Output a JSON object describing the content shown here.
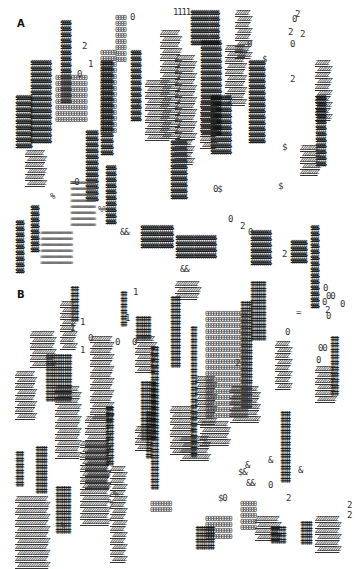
{
  "figure": {
    "panels": [
      {
        "id": "A",
        "label": "A",
        "label_pos": [
          17,
          24
        ],
        "legend_symbols": [
          "$",
          "0",
          "2",
          "Z",
          "=",
          "&",
          "%",
          "1"
        ],
        "blobs": [
          {
            "type": "dollar",
            "x": 60,
            "y": 20,
            "cols": 5,
            "rows": 14,
            "ch": "$"
          },
          {
            "type": "dollar",
            "x": 30,
            "y": 60,
            "cols": 10,
            "rows": 14,
            "ch": "$"
          },
          {
            "type": "zero",
            "x": 55,
            "y": 75,
            "cols": 12,
            "rows": 8,
            "ch": "0"
          },
          {
            "type": "dollar",
            "x": 15,
            "y": 95,
            "cols": 8,
            "rows": 9,
            "ch": "$"
          },
          {
            "type": "zero",
            "x": 115,
            "y": 15,
            "cols": 4,
            "rows": 8,
            "ch": "0"
          },
          {
            "type": "zero",
            "x": 100,
            "y": 50,
            "cols": 6,
            "rows": 14,
            "ch": "0"
          },
          {
            "type": "dollar",
            "x": 100,
            "y": 60,
            "cols": 6,
            "rows": 16,
            "ch": "$"
          },
          {
            "type": "dollar",
            "x": 130,
            "y": 50,
            "cols": 5,
            "rows": 12,
            "ch": "$"
          },
          {
            "type": "hatch",
            "x": 145,
            "y": 80,
            "cols": 10,
            "rows": 10,
            "ch": "Z"
          },
          {
            "type": "hatch",
            "x": 160,
            "y": 30,
            "cols": 8,
            "rows": 18,
            "ch": "Z"
          },
          {
            "type": "dollar",
            "x": 190,
            "y": 10,
            "cols": 14,
            "rows": 6,
            "ch": "$"
          },
          {
            "type": "hatch",
            "x": 235,
            "y": 10,
            "cols": 6,
            "rows": 8,
            "ch": "Z"
          },
          {
            "type": "dollar",
            "x": 200,
            "y": 40,
            "cols": 10,
            "rows": 16,
            "ch": "$"
          },
          {
            "type": "hatch",
            "x": 175,
            "y": 55,
            "cols": 8,
            "rows": 14,
            "ch": "Z"
          },
          {
            "type": "hatch",
            "x": 225,
            "y": 45,
            "cols": 8,
            "rows": 10,
            "ch": "Z"
          },
          {
            "type": "dollar",
            "x": 248,
            "y": 60,
            "cols": 8,
            "rows": 14,
            "ch": "$"
          },
          {
            "type": "dollar",
            "x": 210,
            "y": 95,
            "cols": 10,
            "rows": 10,
            "ch": "$"
          },
          {
            "type": "hatch",
            "x": 200,
            "y": 100,
            "cols": 6,
            "rows": 8,
            "ch": "Z"
          },
          {
            "type": "hatch",
            "x": 315,
            "y": 60,
            "cols": 6,
            "rows": 10,
            "ch": "Z"
          },
          {
            "type": "dollar",
            "x": 315,
            "y": 95,
            "cols": 5,
            "rows": 12,
            "ch": "$"
          },
          {
            "type": "hatch",
            "x": 300,
            "y": 145,
            "cols": 8,
            "rows": 5,
            "ch": "Z"
          },
          {
            "type": "dollar",
            "x": 170,
            "y": 140,
            "cols": 8,
            "rows": 10,
            "ch": "$"
          },
          {
            "type": "hatch",
            "x": 175,
            "y": 140,
            "cols": 7,
            "rows": 4,
            "ch": "Z"
          },
          {
            "type": "dollar",
            "x": 85,
            "y": 130,
            "cols": 6,
            "rows": 12,
            "ch": "$"
          },
          {
            "type": "hatch",
            "x": 25,
            "y": 150,
            "cols": 8,
            "rows": 6,
            "ch": "Z"
          },
          {
            "type": "dash",
            "x": 70,
            "y": 180,
            "cols": 14,
            "rows": 8,
            "ch": "="
          },
          {
            "type": "dash",
            "x": 40,
            "y": 230,
            "cols": 18,
            "rows": 6,
            "ch": "="
          },
          {
            "type": "dollar",
            "x": 15,
            "y": 220,
            "cols": 4,
            "rows": 9,
            "ch": "$"
          },
          {
            "type": "dollar",
            "x": 30,
            "y": 205,
            "cols": 4,
            "rows": 8,
            "ch": "$"
          },
          {
            "type": "dollar",
            "x": 105,
            "y": 165,
            "cols": 5,
            "rows": 10,
            "ch": "$"
          },
          {
            "type": "dollar",
            "x": 140,
            "y": 225,
            "cols": 16,
            "rows": 4,
            "ch": "$"
          },
          {
            "type": "dollar",
            "x": 175,
            "y": 235,
            "cols": 20,
            "rows": 4,
            "ch": "$"
          },
          {
            "type": "dollar",
            "x": 250,
            "y": 230,
            "cols": 10,
            "rows": 6,
            "ch": "$"
          },
          {
            "type": "dollar",
            "x": 310,
            "y": 225,
            "cols": 4,
            "rows": 14,
            "ch": "$"
          },
          {
            "type": "dollar",
            "x": 290,
            "y": 240,
            "cols": 8,
            "rows": 4,
            "ch": "$"
          }
        ],
        "singles": [
          {
            "x": 173,
            "y": 8,
            "t": "1111"
          },
          {
            "x": 82,
            "y": 42,
            "t": "2"
          },
          {
            "x": 88,
            "y": 60,
            "t": "1"
          },
          {
            "x": 77,
            "y": 70,
            "t": "0"
          },
          {
            "x": 135,
            "y": 100,
            "t": "2"
          },
          {
            "x": 130,
            "y": 13,
            "t": "0"
          },
          {
            "x": 295,
            "y": 10,
            "t": "2"
          },
          {
            "x": 300,
            "y": 30,
            "t": "2"
          },
          {
            "x": 290,
            "y": 40,
            "t": "0"
          },
          {
            "x": 292,
            "y": 15,
            "t": "0"
          },
          {
            "x": 288,
            "y": 28,
            "t": "2"
          },
          {
            "x": 290,
            "y": 75,
            "t": "2"
          },
          {
            "x": 247,
            "y": 40,
            "t": "0"
          },
          {
            "x": 262,
            "y": 55,
            "t": "$"
          },
          {
            "x": 282,
            "y": 143,
            "t": "$"
          },
          {
            "x": 278,
            "y": 182,
            "t": "$"
          },
          {
            "x": 213,
            "y": 185,
            "t": "0$"
          },
          {
            "x": 228,
            "y": 215,
            "t": "0"
          },
          {
            "x": 248,
            "y": 228,
            "t": "0"
          },
          {
            "x": 240,
            "y": 222,
            "t": "2"
          },
          {
            "x": 70,
            "y": 178,
            "t": "=0"
          },
          {
            "x": 98,
            "y": 205,
            "t": "%%"
          },
          {
            "x": 50,
            "y": 192,
            "t": "%"
          },
          {
            "x": 120,
            "y": 228,
            "t": "&&"
          },
          {
            "x": 282,
            "y": 250,
            "t": "2"
          },
          {
            "x": 180,
            "y": 265,
            "t": "&&"
          }
        ]
      },
      {
        "id": "B",
        "label": "B",
        "label_pos": [
          17,
          295
        ],
        "legend_symbols": [
          "‡",
          "2",
          "Z",
          "0",
          "$",
          "=",
          "&",
          "%",
          "1"
        ],
        "blobs": [
          {
            "type": "dagger",
            "x": 70,
            "y": 10,
            "cols": 4,
            "rows": 6,
            "ch": "‡"
          },
          {
            "type": "hatch",
            "x": 60,
            "y": 25,
            "cols": 6,
            "rows": 8,
            "ch": "Z"
          },
          {
            "type": "hatch",
            "x": 30,
            "y": 55,
            "cols": 10,
            "rows": 6,
            "ch": "Z"
          },
          {
            "type": "dagger",
            "x": 45,
            "y": 78,
            "cols": 14,
            "rows": 8,
            "ch": "‡"
          },
          {
            "type": "hatch",
            "x": 15,
            "y": 95,
            "cols": 8,
            "rows": 8,
            "ch": "Z"
          },
          {
            "type": "hatch",
            "x": 90,
            "y": 60,
            "cols": 9,
            "rows": 14,
            "ch": "Z"
          },
          {
            "type": "dagger",
            "x": 120,
            "y": 15,
            "cols": 3,
            "rows": 6,
            "ch": "‡"
          },
          {
            "type": "dagger",
            "x": 135,
            "y": 40,
            "cols": 8,
            "rows": 4,
            "ch": "‡"
          },
          {
            "type": "hatch",
            "x": 135,
            "y": 60,
            "cols": 8,
            "rows": 6,
            "ch": "Z"
          },
          {
            "type": "dagger",
            "x": 150,
            "y": 70,
            "cols": 4,
            "rows": 24,
            "ch": "‡"
          },
          {
            "type": "dagger",
            "x": 140,
            "y": 105,
            "cols": 8,
            "rows": 10,
            "ch": "‡"
          },
          {
            "type": "hatch",
            "x": 55,
            "y": 110,
            "cols": 10,
            "rows": 12,
            "ch": "Z"
          },
          {
            "type": "hatch",
            "x": 85,
            "y": 140,
            "cols": 10,
            "rows": 12,
            "ch": "Z"
          },
          {
            "type": "dagger",
            "x": 105,
            "y": 130,
            "cols": 4,
            "rows": 10,
            "ch": "‡"
          },
          {
            "type": "hatch",
            "x": 175,
            "y": 5,
            "cols": 10,
            "rows": 3,
            "ch": "Z"
          },
          {
            "type": "dagger",
            "x": 170,
            "y": 20,
            "cols": 5,
            "rows": 12,
            "ch": "‡"
          },
          {
            "type": "dagger",
            "x": 250,
            "y": 5,
            "cols": 8,
            "rows": 10,
            "ch": "‡"
          },
          {
            "type": "dagger",
            "x": 240,
            "y": 25,
            "cols": 6,
            "rows": 18,
            "ch": "‡"
          },
          {
            "type": "zero",
            "x": 205,
            "y": 35,
            "cols": 16,
            "rows": 18,
            "ch": "0"
          },
          {
            "type": "hatch",
            "x": 275,
            "y": 65,
            "cols": 6,
            "rows": 8,
            "ch": "Z"
          },
          {
            "type": "dagger",
            "x": 190,
            "y": 50,
            "cols": 3,
            "rows": 22,
            "ch": "‡"
          },
          {
            "type": "hatch",
            "x": 195,
            "y": 100,
            "cols": 8,
            "rows": 8,
            "ch": "Z"
          },
          {
            "type": "hatch",
            "x": 230,
            "y": 110,
            "cols": 12,
            "rows": 6,
            "ch": "Z"
          },
          {
            "type": "dagger",
            "x": 330,
            "y": 60,
            "cols": 4,
            "rows": 10,
            "ch": "‡"
          },
          {
            "type": "hatch",
            "x": 315,
            "y": 90,
            "cols": 8,
            "rows": 6,
            "ch": "Z"
          },
          {
            "type": "hatch",
            "x": 170,
            "y": 130,
            "cols": 10,
            "rows": 8,
            "ch": "Z"
          },
          {
            "type": "hatch",
            "x": 200,
            "y": 145,
            "cols": 12,
            "rows": 4,
            "ch": "Z"
          },
          {
            "type": "dagger",
            "x": 15,
            "y": 175,
            "cols": 4,
            "rows": 6,
            "ch": "‡"
          },
          {
            "type": "dagger",
            "x": 35,
            "y": 170,
            "cols": 6,
            "rows": 8,
            "ch": "‡"
          },
          {
            "type": "dagger",
            "x": 55,
            "y": 210,
            "cols": 8,
            "rows": 8,
            "ch": "‡"
          },
          {
            "type": "hatch",
            "x": 15,
            "y": 220,
            "cols": 14,
            "rows": 12,
            "ch": "Z"
          },
          {
            "type": "hatch",
            "x": 80,
            "y": 165,
            "cols": 12,
            "rows": 14,
            "ch": "Z"
          },
          {
            "type": "hatch",
            "x": 110,
            "y": 190,
            "cols": 6,
            "rows": 16,
            "ch": "Z"
          },
          {
            "type": "zero",
            "x": 150,
            "y": 225,
            "cols": 8,
            "rows": 2,
            "ch": "0"
          },
          {
            "type": "hatch",
            "x": 135,
            "y": 150,
            "cols": 6,
            "rows": 4,
            "ch": "Z"
          },
          {
            "type": "dagger",
            "x": 145,
            "y": 135,
            "cols": 3,
            "rows": 8,
            "ch": "‡"
          },
          {
            "type": "hatch",
            "x": 180,
            "y": 160,
            "cols": 12,
            "rows": 4,
            "ch": "Z"
          },
          {
            "type": "dagger",
            "x": 280,
            "y": 135,
            "cols": 5,
            "rows": 12,
            "ch": "‡"
          },
          {
            "type": "zero",
            "x": 240,
            "y": 225,
            "cols": 6,
            "rows": 5,
            "ch": "0"
          },
          {
            "type": "hatch",
            "x": 255,
            "y": 240,
            "cols": 10,
            "rows": 4,
            "ch": "Z"
          },
          {
            "type": "zero",
            "x": 205,
            "y": 240,
            "cols": 10,
            "rows": 4,
            "ch": "0"
          },
          {
            "type": "dagger",
            "x": 195,
            "y": 250,
            "cols": 10,
            "rows": 4,
            "ch": "‡"
          },
          {
            "type": "dagger",
            "x": 300,
            "y": 245,
            "cols": 6,
            "rows": 4,
            "ch": "‡"
          },
          {
            "type": "hatch",
            "x": 315,
            "y": 240,
            "cols": 10,
            "rows": 6,
            "ch": "Z"
          },
          {
            "type": "dagger",
            "x": 270,
            "y": 250,
            "cols": 8,
            "rows": 3,
            "ch": "‡"
          }
        ],
        "singles": [
          {
            "x": 133,
            "y": 12,
            "t": "1"
          },
          {
            "x": 125,
            "y": 38,
            "t": "1"
          },
          {
            "x": 80,
            "y": 42,
            "t": "1"
          },
          {
            "x": 70,
            "y": 48,
            "t": "1"
          },
          {
            "x": 80,
            "y": 70,
            "t": "1"
          },
          {
            "x": 88,
            "y": 58,
            "t": "0"
          },
          {
            "x": 115,
            "y": 62,
            "t": "0"
          },
          {
            "x": 132,
            "y": 62,
            "t": "0"
          },
          {
            "x": 323,
            "y": 8,
            "t": "0"
          },
          {
            "x": 326,
            "y": 16,
            "t": "00"
          },
          {
            "x": 322,
            "y": 22,
            "t": "0"
          },
          {
            "x": 325,
            "y": 30,
            "t": "2"
          },
          {
            "x": 326,
            "y": 36,
            "t": "0"
          },
          {
            "x": 340,
            "y": 24,
            "t": "0"
          },
          {
            "x": 296,
            "y": 32,
            "t": "="
          },
          {
            "x": 285,
            "y": 52,
            "t": "0"
          },
          {
            "x": 318,
            "y": 68,
            "t": "00"
          },
          {
            "x": 316,
            "y": 80,
            "t": "0"
          },
          {
            "x": 235,
            "y": 83,
            "t": "2"
          },
          {
            "x": 150,
            "y": 150,
            "t": "2"
          },
          {
            "x": 268,
            "y": 180,
            "t": "&"
          },
          {
            "x": 298,
            "y": 190,
            "t": "&"
          },
          {
            "x": 245,
            "y": 185,
            "t": "&"
          },
          {
            "x": 238,
            "y": 192,
            "t": "$&"
          },
          {
            "x": 246,
            "y": 203,
            "t": "&&"
          },
          {
            "x": 268,
            "y": 205,
            "t": "0"
          },
          {
            "x": 286,
            "y": 218,
            "t": "2"
          },
          {
            "x": 218,
            "y": 218,
            "t": "$0"
          },
          {
            "x": 347,
            "y": 225,
            "t": "2"
          },
          {
            "x": 347,
            "y": 235,
            "t": "2"
          },
          {
            "x": 113,
            "y": 214,
            "t": "%"
          },
          {
            "x": 108,
            "y": 222,
            "t": "%"
          },
          {
            "x": 60,
            "y": 245,
            "t": "%"
          }
        ]
      }
    ]
  }
}
